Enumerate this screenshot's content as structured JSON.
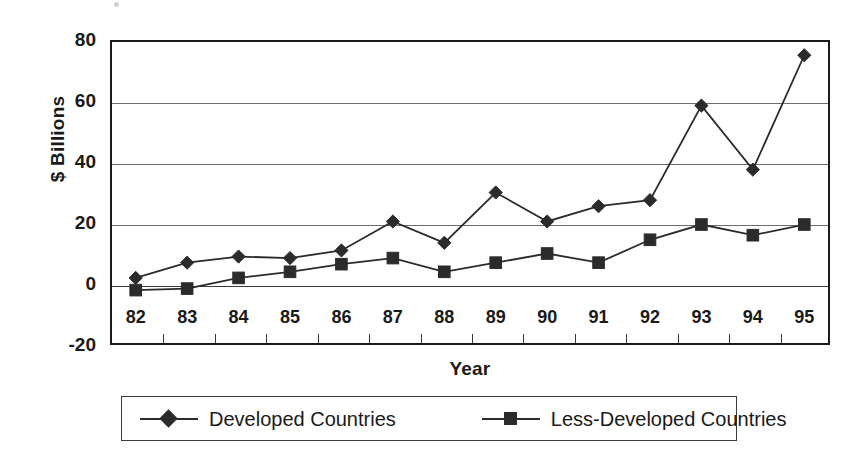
{
  "chart_data": {
    "type": "line",
    "title": "",
    "xlabel": "Year",
    "ylabel": "$ Billions",
    "categories": [
      "82",
      "83",
      "84",
      "85",
      "86",
      "87",
      "88",
      "89",
      "90",
      "91",
      "92",
      "93",
      "94",
      "95"
    ],
    "x_tick_labels": [
      "82",
      "83",
      "84",
      "85",
      "86",
      "87",
      "88",
      "89",
      "90",
      "91",
      "92",
      "93",
      "94",
      "95"
    ],
    "y_tick_labels": [
      "80",
      "60",
      "40",
      "20",
      "0",
      "-20"
    ],
    "y_ticks": [
      80,
      60,
      40,
      20,
      0,
      -20
    ],
    "ylim": [
      -20,
      80
    ],
    "grid": "horizontal",
    "legend_position": "bottom",
    "series": [
      {
        "name": "Developed Countries",
        "marker": "diamond",
        "color": "#2b2b2b",
        "values": [
          2,
          7,
          9,
          8.5,
          11,
          20.5,
          13.5,
          30,
          20.5,
          25.5,
          27.5,
          58.5,
          37.5,
          75
        ]
      },
      {
        "name": "Less-Developed Countries",
        "marker": "square",
        "color": "#2b2b2b",
        "values": [
          -2,
          -1.5,
          2,
          4,
          6.5,
          8.5,
          4,
          7,
          10,
          7,
          14.5,
          19.5,
          16,
          19.5
        ]
      }
    ]
  },
  "legend": {
    "entries": [
      {
        "label": "Developed Countries",
        "marker": "diamond"
      },
      {
        "label": "Less-Developed Countries",
        "marker": "square"
      }
    ]
  },
  "axes": {
    "y_title": "$ Billions",
    "x_title": "Year"
  },
  "colors": {
    "series_ink": "#2b2b2b",
    "grid": "#6d6d6d",
    "frame": "#1a1a1a",
    "background": "#ffffff"
  }
}
